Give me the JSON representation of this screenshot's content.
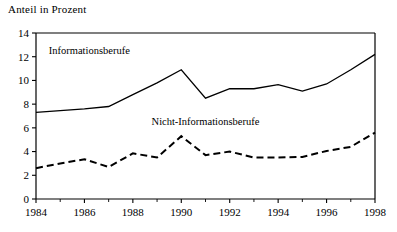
{
  "figure": {
    "axis_title": "Anteil in Prozent"
  },
  "chart_data": {
    "type": "line",
    "title": "Anteil in Prozent",
    "subtitle": "",
    "xlabel": "",
    "ylabel": "Anteil in Prozent",
    "x": [
      1984,
      1985,
      1986,
      1987,
      1988,
      1989,
      1990,
      1991,
      1992,
      1993,
      1994,
      1995,
      1996,
      1997,
      1998
    ],
    "xlim": [
      1984,
      1998
    ],
    "ylim": [
      0,
      14
    ],
    "ytick_labels": [
      "0",
      "2",
      "4",
      "6",
      "8",
      "10",
      "12",
      "14"
    ],
    "yticks": [
      0,
      2,
      4,
      6,
      8,
      10,
      12,
      14
    ],
    "xtick_labels": [
      "1984",
      "1986",
      "1988",
      "1990",
      "1992",
      "1994",
      "1996",
      "1998"
    ],
    "xticks": [
      1984,
      1986,
      1988,
      1990,
      1992,
      1994,
      1996,
      1998
    ],
    "xtick_minor": [
      1985,
      1987,
      1989,
      1991,
      1993,
      1995,
      1997
    ],
    "grid": false,
    "legend_position": "inline-annotation",
    "series": [
      {
        "name": "Informationsberufe",
        "style": "solid",
        "color": "#000000",
        "label_x": 1986.2,
        "label_y": 12.2,
        "values": [
          7.3,
          7.45,
          7.6,
          7.8,
          8.8,
          9.8,
          10.9,
          8.5,
          9.3,
          9.3,
          9.65,
          9.1,
          9.7,
          10.9,
          12.2
        ]
      },
      {
        "name": "Nicht-Informationsberufe",
        "style": "dashed",
        "color": "#000000",
        "label_x": 1991.0,
        "label_y": 6.25,
        "values": [
          2.6,
          3.0,
          3.35,
          2.7,
          3.85,
          3.5,
          5.3,
          3.7,
          4.0,
          3.5,
          3.5,
          3.55,
          4.05,
          4.4,
          5.6
        ]
      }
    ]
  }
}
